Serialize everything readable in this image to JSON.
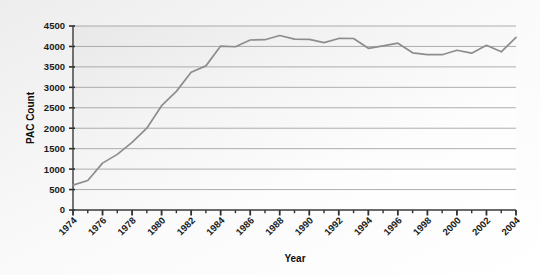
{
  "chart_data": {
    "type": "line",
    "title": "",
    "xlabel": "Year",
    "ylabel": "PAC Count",
    "xlim": [
      1974,
      2004
    ],
    "ylim": [
      0,
      4500
    ],
    "grid": true,
    "legend_position": "none",
    "line_color": "#8d8d8d",
    "axis_color": "#3a3a3a",
    "grid_color": "#9a9a9a",
    "y_ticks": [
      0,
      500,
      1000,
      1500,
      2000,
      2500,
      3000,
      3500,
      4000,
      4500
    ],
    "y_tick_labels": [
      "0",
      "500",
      "1000",
      "1500",
      "2000",
      "2500",
      "3000",
      "3500",
      "4000",
      "4500"
    ],
    "x_ticks": [
      1974,
      1975,
      1976,
      1977,
      1978,
      1979,
      1980,
      1981,
      1982,
      1983,
      1984,
      1985,
      1986,
      1987,
      1988,
      1989,
      1990,
      1991,
      1992,
      1993,
      1994,
      1995,
      1996,
      1997,
      1998,
      1999,
      2000,
      2001,
      2002,
      2003,
      2004
    ],
    "x_tick_labels": [
      "1974",
      "1976",
      "1978",
      "1980",
      "1982",
      "1984",
      "1986",
      "1988",
      "1990",
      "1992",
      "1994",
      "1996",
      "1998",
      "2000",
      "2002",
      "2004"
    ],
    "x_labeled_ticks": [
      1974,
      1976,
      1978,
      1980,
      1982,
      1984,
      1986,
      1988,
      1990,
      1992,
      1994,
      1996,
      1998,
      2000,
      2002,
      2004
    ],
    "x": [
      1974,
      1975,
      1976,
      1977,
      1978,
      1979,
      1980,
      1981,
      1982,
      1983,
      1984,
      1985,
      1986,
      1987,
      1988,
      1989,
      1990,
      1991,
      1992,
      1993,
      1994,
      1995,
      1996,
      1997,
      1998,
      1999,
      2000,
      2001,
      2002,
      2003,
      2004
    ],
    "values": [
      608,
      722,
      1146,
      1360,
      1653,
      2000,
      2551,
      2901,
      3371,
      3525,
      4009,
      3992,
      4157,
      4165,
      4268,
      4178,
      4172,
      4094,
      4195,
      4194,
      3954,
      4016,
      4079,
      3844,
      3798,
      3798,
      3907,
      3835,
      4027,
      3868,
      4220
    ],
    "annotations": []
  },
  "axis": {
    "y_title": "PAC Count",
    "x_title": "Year"
  }
}
